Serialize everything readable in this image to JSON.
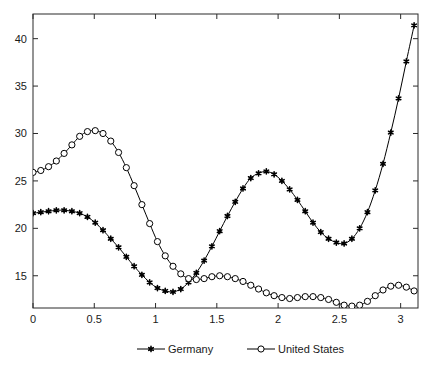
{
  "chart_data": {
    "type": "line",
    "title": "",
    "subtitle": "",
    "xlabel": "",
    "ylabel": "",
    "xlim": [
      0,
      3.1416
    ],
    "ylim": [
      11.6,
      42.6
    ],
    "grid": false,
    "legend_position": "bottom-center",
    "xticks": [
      "0",
      "0.5",
      "1",
      "1.5",
      "2",
      "2.5",
      "3"
    ],
    "xtick_values": [
      0,
      0.5,
      1,
      1.5,
      2,
      2.5,
      3
    ],
    "yticks": [
      "15",
      "20",
      "25",
      "30",
      "35",
      "40"
    ],
    "ytick_values": [
      15,
      20,
      25,
      30,
      35,
      40
    ],
    "x": [
      0,
      0.0635,
      0.127,
      0.1904,
      0.2539,
      0.3174,
      0.3808,
      0.4443,
      0.5078,
      0.5712,
      0.6347,
      0.6982,
      0.7616,
      0.8251,
      0.8886,
      0.952,
      1.0155,
      1.079,
      1.1424,
      1.2059,
      1.2694,
      1.3328,
      1.3963,
      1.4598,
      1.5232,
      1.5867,
      1.6502,
      1.7136,
      1.7771,
      1.8406,
      1.904,
      1.9675,
      2.031,
      2.0944,
      2.1579,
      2.2214,
      2.2848,
      2.3483,
      2.4118,
      2.4752,
      2.5387,
      2.6022,
      2.6656,
      2.7291,
      2.7926,
      2.856,
      2.9195,
      2.983,
      3.0464,
      3.1099
    ],
    "series": [
      {
        "name": "Germany",
        "marker": "star",
        "marker_filled": true,
        "color": "#000000",
        "values": [
          21.6,
          21.7,
          21.8,
          21.9,
          21.9,
          21.8,
          21.6,
          21.2,
          20.6,
          19.8,
          18.9,
          18.0,
          17.0,
          16.0,
          15.1,
          14.3,
          13.7,
          13.4,
          13.3,
          13.6,
          14.3,
          15.3,
          16.6,
          18.1,
          19.7,
          21.3,
          22.8,
          24.2,
          25.3,
          25.8,
          26.0,
          25.7,
          25.0,
          24.1,
          23.0,
          21.8,
          20.6,
          19.6,
          18.9,
          18.5,
          18.4,
          18.9,
          20.0,
          21.7,
          24.0,
          26.8,
          30.1,
          33.7,
          37.6,
          41.4
        ]
      },
      {
        "name": "United States",
        "marker": "circle",
        "marker_filled": false,
        "color": "#000000",
        "values": [
          25.9,
          26.1,
          26.5,
          27.1,
          27.9,
          28.8,
          29.7,
          30.2,
          30.3,
          30.0,
          29.2,
          28.0,
          26.4,
          24.5,
          22.5,
          20.5,
          18.6,
          17.1,
          16.0,
          15.2,
          14.7,
          14.6,
          14.7,
          14.9,
          15.0,
          14.9,
          14.7,
          14.4,
          14.0,
          13.6,
          13.2,
          12.9,
          12.7,
          12.6,
          12.7,
          12.8,
          12.8,
          12.7,
          12.5,
          12.2,
          11.9,
          11.8,
          11.9,
          12.3,
          12.9,
          13.5,
          13.9,
          14.0,
          13.8,
          13.4
        ]
      }
    ]
  },
  "legend": {
    "entries": [
      {
        "label": "Germany"
      },
      {
        "label": "United States"
      }
    ]
  }
}
